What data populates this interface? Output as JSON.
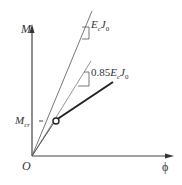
{
  "diagram": {
    "y_axis_label": "M",
    "x_axis_label": "ϕ",
    "origin_label": "O",
    "cracking_moment_label": "M",
    "cracking_moment_sub": "cr",
    "line1_label": "E",
    "line1_sub1": "c",
    "line1_mid": "J",
    "line1_sub2": "0",
    "line2_prefix": "0.85",
    "line2_label": "E",
    "line2_sub1": "c",
    "line2_mid": "J",
    "line2_sub2": "0"
  }
}
